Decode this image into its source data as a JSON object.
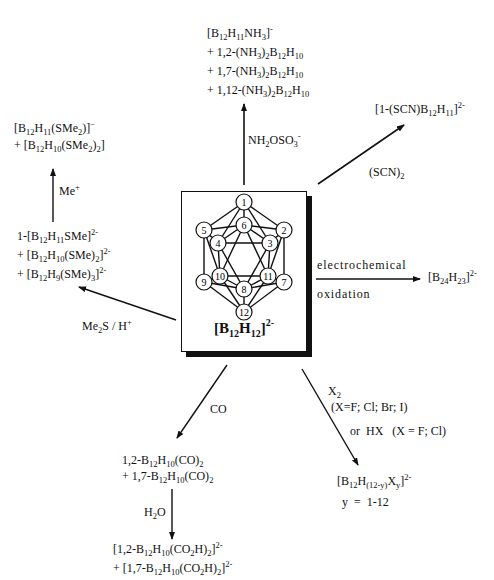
{
  "diagram": {
    "center": {
      "formula_html": "[B<sub>12</sub>H<sub>12</sub>]<sup>2-</sup>",
      "cage_vertices": [
        {
          "n": "1",
          "x": 62,
          "y": 10
        },
        {
          "n": "6",
          "x": 62,
          "y": 33
        },
        {
          "n": "5",
          "x": 22,
          "y": 38
        },
        {
          "n": "2",
          "x": 102,
          "y": 38
        },
        {
          "n": "4",
          "x": 36,
          "y": 51
        },
        {
          "n": "3",
          "x": 88,
          "y": 51
        },
        {
          "n": "10",
          "x": 38,
          "y": 84
        },
        {
          "n": "11",
          "x": 86,
          "y": 84
        },
        {
          "n": "9",
          "x": 22,
          "y": 90
        },
        {
          "n": "7",
          "x": 102,
          "y": 90
        },
        {
          "n": "8",
          "x": 62,
          "y": 97
        },
        {
          "n": "12",
          "x": 62,
          "y": 120
        }
      ]
    },
    "reactions": {
      "top": {
        "reagent_html": "NH<sub>2</sub>OSO<sub>3</sub><sup>-</sup>",
        "products_html": [
          "[B<sub>12</sub>H<sub>11</sub>NH<sub>3</sub>]<sup>-</sup>",
          "+ 1,2-(NH<sub>3</sub>)<sub>2</sub>B<sub>12</sub>H<sub>10</sub>",
          "+ 1,7-(NH<sub>3</sub>)<sub>2</sub>B<sub>12</sub>H<sub>10</sub>",
          "+ 1,12-(NH<sub>3</sub>)<sub>2</sub>B<sub>12</sub>H<sub>10</sub>"
        ]
      },
      "upper_right": {
        "reagent_html": "(SCN)<sub>2</sub>",
        "products_html": [
          "[1-(SCN)B<sub>12</sub>H<sub>11</sub>]<sup>2-</sup>"
        ]
      },
      "right": {
        "reagent_above": "electrochemical",
        "reagent_below": "oxidation",
        "products_html": [
          "[B<sub>24</sub>H<sub>23</sub>]<sup>2-</sup>"
        ]
      },
      "lower_right": {
        "reagent_lines_html": [
          "X<sub>2</sub>",
          "(X=F; Cl; Br; I)",
          "or&nbsp; HX &nbsp;&nbsp;(X = F; Cl)"
        ],
        "products_html": [
          "[B<sub>12</sub>H<sub>(12-y)</sub>X<sub>y</sub>]<sup>2-</sup>",
          "y &nbsp;= &nbsp;1-12"
        ]
      },
      "lower_left": {
        "reagent_html": "CO",
        "products_html": [
          "1,2-B<sub>12</sub>H<sub>10</sub>(CO)<sub>2</sub>",
          "+ 1,7-B<sub>12</sub>H<sub>10</sub>(CO)<sub>2</sub>"
        ],
        "followup": {
          "reagent_html": "H<sub>2</sub>O",
          "products_html": [
            "[1,2-B<sub>12</sub>H<sub>10</sub>(CO<sub>2</sub>H)<sub>2</sub>]<sup>2-</sup>",
            "+ [1,7-B<sub>12</sub>H<sub>10</sub>(CO<sub>2</sub>H)<sub>2</sub>]<sup>2-</sup>"
          ]
        }
      },
      "left": {
        "reagent_html": "Me<sub>2</sub>S / H<sup>+</sup>",
        "products_html": [
          "1-[B<sub>12</sub>H<sub>11</sub>SMe]<sup>2-</sup>",
          "+ [B<sub>12</sub>H<sub>10</sub>(SMe)<sub>2</sub>]<sup>2-</sup>",
          "+ [B<sub>12</sub>H<sub>9</sub>(SMe)<sub>3</sub>]<sup>2-</sup>"
        ],
        "followup": {
          "reagent_html": "Me<sup>+</sup>",
          "products_html": [
            "[B<sub>12</sub>H<sub>11</sub>(SMe<sub>2</sub>)]<sup>&minus;</sup>",
            "+ [B<sub>12</sub>H<sub>10</sub>(SMe<sub>2</sub>)<sub>2</sub>]"
          ]
        }
      }
    }
  }
}
